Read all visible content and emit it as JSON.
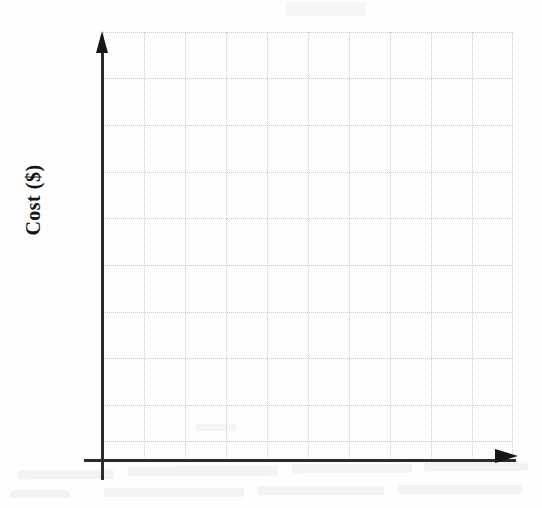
{
  "figure": {
    "kind": "blank-graph-worksheet",
    "background_color": "#fefefe",
    "axis_color": "#2b2b2b",
    "grid_color": "#c9c9cc",
    "label_color": "#151515"
  },
  "axes": {
    "y_axis_label": "Cost ($)",
    "x_axis_label": "",
    "y_axis_arrow_icon": "arrow-up-icon",
    "x_axis_arrow_icon": "arrow-right-icon",
    "origin_px": {
      "x": 103,
      "y": 460
    }
  },
  "chart_data": {
    "type": "line",
    "title": "",
    "subtitle": "",
    "xlabel": "",
    "ylabel": "Cost ($)",
    "series": [],
    "x": [],
    "categories": [],
    "values": [],
    "annotations": [],
    "legend": {
      "entries": [],
      "position": "none"
    },
    "grid": {
      "enabled": true,
      "style": "dotted",
      "color": "#c9c9cc",
      "vertical_lines": 10,
      "horizontal_lines": 10,
      "vertical_positions_px": [
        0,
        41,
        82,
        123,
        164,
        205,
        246,
        287,
        328,
        369,
        409
      ],
      "horizontal_positions_px": [
        0,
        46,
        93,
        140,
        186,
        233,
        280,
        326,
        373,
        409,
        428
      ]
    },
    "xlim": [
      0,
      10
    ],
    "ylim": [
      0,
      10
    ],
    "xticklabels": [],
    "yticklabels": [],
    "note": "Empty plotting area — no data plotted on the grid."
  },
  "artifacts": {
    "description": "faint scanner bleed-through smudges below the horizontal axis",
    "count": 10
  }
}
